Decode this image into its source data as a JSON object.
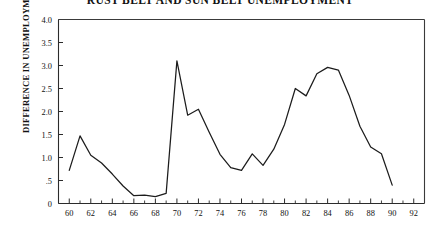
{
  "chart_data": {
    "type": "line",
    "title": "RUST BELT AND SUN BELT UNEMPLOYMENT",
    "xlabel": "",
    "ylabel": "DIFFERENCE IN UNEMPLOYMENT RATE",
    "xlim": [
      59,
      93
    ],
    "ylim": [
      0,
      4.0
    ],
    "grid": false,
    "legend": null,
    "y_ticks": [
      0,
      0.5,
      1.0,
      1.5,
      2.0,
      2.5,
      3.0,
      3.5,
      4.0
    ],
    "y_tick_labels": [
      "0",
      ".5",
      "1.0",
      "1.5",
      "2.0",
      "2.5",
      "3.0",
      "3.5",
      "4.0"
    ],
    "x_ticks": [
      60,
      62,
      64,
      66,
      68,
      70,
      72,
      74,
      76,
      78,
      80,
      82,
      84,
      86,
      88,
      90,
      92
    ],
    "x_tick_labels": [
      "60",
      "62",
      "64",
      "66",
      "68",
      "70",
      "72",
      "74",
      "76",
      "78",
      "80",
      "82",
      "84",
      "86",
      "88",
      "90",
      "92"
    ],
    "x_minor_ticks": [
      61,
      63,
      65,
      67,
      69,
      71,
      73,
      75,
      77,
      79,
      81,
      83,
      85,
      87,
      89,
      91
    ],
    "series": [
      {
        "name": "Difference in Unemployment Rate",
        "color": "#1c1c1c",
        "x": [
          60,
          61,
          62,
          63,
          64,
          65,
          66,
          67,
          68,
          69,
          70,
          71,
          72,
          73,
          74,
          75,
          76,
          77,
          78,
          79,
          80,
          81,
          82,
          83,
          84,
          85,
          86,
          87,
          88,
          89,
          90
        ],
        "y": [
          0.72,
          1.47,
          1.05,
          0.88,
          0.64,
          0.38,
          0.17,
          0.18,
          0.15,
          0.22,
          3.1,
          1.92,
          2.05,
          1.55,
          1.07,
          0.78,
          0.72,
          1.08,
          0.83,
          1.18,
          1.72,
          2.5,
          2.34,
          2.82,
          2.96,
          2.9,
          2.35,
          1.68,
          1.23,
          1.08,
          0.4
        ]
      }
    ]
  }
}
